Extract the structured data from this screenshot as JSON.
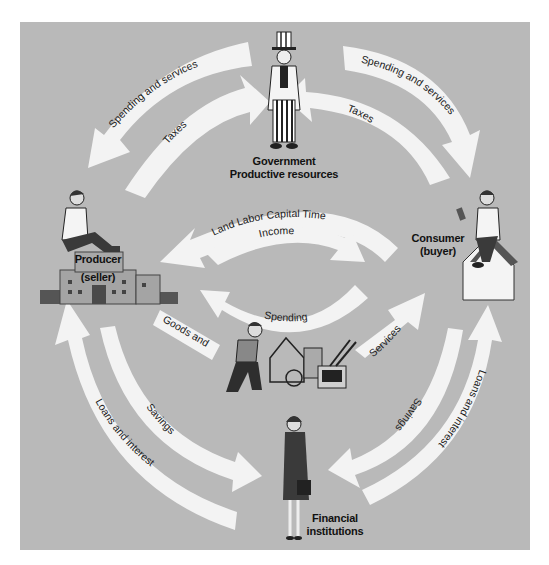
{
  "diagram": {
    "colors": {
      "background": "#b9b9b9",
      "arrow": "#f3f3f3",
      "text": "#111111"
    },
    "nodes": {
      "government": {
        "line1": "Government",
        "line2": "Productive resources"
      },
      "producer": {
        "line1": "Producer",
        "line2": "(seller)"
      },
      "consumer": {
        "line1": "Consumer",
        "line2": "(buyer)"
      },
      "financial": {
        "line1": "Financial",
        "line2": "institutions"
      },
      "goods": {
        "icon": "goods-and-services-illustration"
      }
    },
    "flows": {
      "gov_to_producer_spending": "Spending and services",
      "producer_to_gov_taxes": "Taxes",
      "gov_to_consumer_spending": "Spending and services",
      "consumer_to_gov_taxes": "Taxes",
      "resources": "Land Labor Capital Time",
      "income": "Income",
      "spending": "Spending",
      "goods": "Goods and",
      "services": "Services",
      "producer_savings": "Savings",
      "producer_loans": "Loans and interest",
      "consumer_savings": "Savings",
      "consumer_loans": "Loans and interest"
    }
  }
}
